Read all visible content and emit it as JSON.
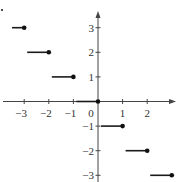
{
  "chart_data": {
    "type": "line",
    "subtype": "step-function",
    "title": "",
    "xlabel": "",
    "ylabel": "",
    "xlim": [
      -3.9,
      3.3
    ],
    "ylim": [
      -3.2,
      4.0
    ],
    "grid": false,
    "legend": null,
    "x_ticks": [
      -3,
      -2,
      -1,
      1,
      2
    ],
    "x_tick_labels": [
      "−3",
      "−2",
      "−1",
      "1",
      "2"
    ],
    "y_ticks": [
      3,
      2,
      1,
      -1,
      -2,
      -3
    ],
    "y_tick_labels": [
      "3",
      "2",
      "1",
      "−1",
      "−2",
      "−3"
    ],
    "origin_label": "0",
    "segments": [
      {
        "x_start": -3.5,
        "x_end": -3,
        "y": 3,
        "closed_end": "right"
      },
      {
        "x_start": -3,
        "x_end": -2,
        "y": 2,
        "closed_end": "right"
      },
      {
        "x_start": -2,
        "x_end": -1,
        "y": 1,
        "closed_end": "right"
      },
      {
        "x_start": -1,
        "x_end": 0,
        "y": 0,
        "closed_end": "right"
      },
      {
        "x_start": 0,
        "x_end": 1,
        "y": -1,
        "closed_end": "right"
      },
      {
        "x_start": 1,
        "x_end": 2,
        "y": -2,
        "closed_end": "right"
      },
      {
        "x_start": 2,
        "x_end": 3,
        "y": -3,
        "closed_end": "right"
      }
    ],
    "partial_segment_top_left": {
      "x": -3.9,
      "y": 4,
      "note": "dot at edge"
    }
  },
  "layout": {
    "origin_px": [
      98,
      101.5
    ],
    "unit_px": 24.6
  }
}
